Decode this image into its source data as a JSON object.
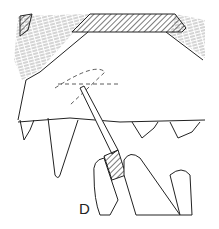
{
  "figure": {
    "label": "D",
    "stroke_color": "#222222",
    "background": "#ffffff"
  }
}
